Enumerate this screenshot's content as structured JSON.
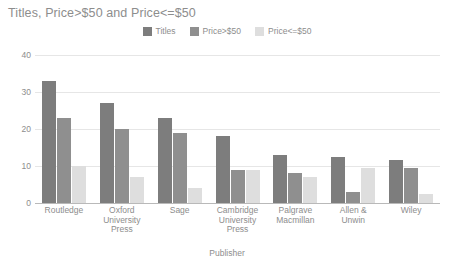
{
  "chart_data": {
    "type": "bar",
    "title": "Titles, Price>$50 and Price<=$50",
    "xlabel": "Publisher",
    "ylabel": "",
    "ylim": [
      0,
      40
    ],
    "yticks": [
      0,
      10,
      20,
      30,
      40
    ],
    "grid": true,
    "legend_position": "top-center",
    "categories": [
      "Routledge",
      "Oxford University Press",
      "Sage",
      "Cambridge University Press",
      "Palgrave Macmillan",
      "Allen & Unwin",
      "Wiley"
    ],
    "category_lines": [
      [
        "Routledge"
      ],
      [
        "Oxford",
        "University",
        "Press"
      ],
      [
        "Sage"
      ],
      [
        "Cambridge",
        "University",
        "Press"
      ],
      [
        "Palgrave",
        "Macmillan"
      ],
      [
        "Allen &",
        "Unwin"
      ],
      [
        "Wiley"
      ]
    ],
    "series": [
      {
        "name": "Titles",
        "color": "#7d7d7d",
        "values": [
          33,
          27,
          23,
          18,
          13,
          12.5,
          11.5
        ]
      },
      {
        "name": "Price>$50",
        "color": "#8f8f8f",
        "values": [
          23,
          20,
          19,
          9,
          8,
          3,
          9.5
        ]
      },
      {
        "name": "Price<=$50",
        "color": "#dedede",
        "values": [
          10,
          7,
          4,
          9,
          7,
          9.5,
          2.5
        ]
      }
    ]
  },
  "colors": {
    "background": "#ffffff",
    "text": "#8d8d8d",
    "gridline": "#e6e6e6",
    "axis": "#b9b9b9"
  }
}
